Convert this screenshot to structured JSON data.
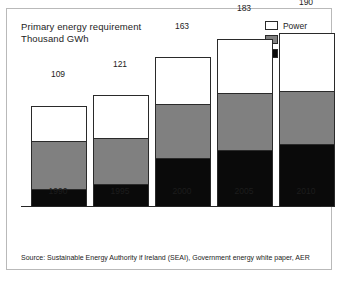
{
  "chart_data": {
    "type": "bar",
    "subtype": "stacked-bar",
    "title": "Primary energy requirement",
    "subtitle": "Thousand GWh",
    "xlabel": "",
    "ylabel": "Thousand GWh",
    "categories": [
      "1990",
      "1995",
      "2000",
      "2005",
      "2010"
    ],
    "totals": [
      109,
      121,
      163,
      183,
      190
    ],
    "ylim": [
      0,
      190
    ],
    "grid": false,
    "legend_position": "top-right",
    "series": [
      {
        "name": "Transport",
        "color": "#0a0a0a",
        "values": [
          18,
          24,
          52,
          62,
          68
        ]
      },
      {
        "name": "Heat",
        "color": "#808080",
        "values": [
          52,
          50,
          60,
          62,
          58
        ]
      },
      {
        "name": "Power",
        "color": "#ffffff",
        "values": [
          39,
          47,
          51,
          59,
          64
        ]
      }
    ],
    "source": "Source: Sustainable Energy Authority if Ireland (SEAI), Government energy white paper, AER"
  },
  "legend": {
    "items": [
      {
        "label": "Power",
        "color": "#ffffff"
      },
      {
        "label": "Heat",
        "color": "#808080"
      },
      {
        "label": "Transport",
        "color": "#0a0a0a"
      }
    ]
  }
}
